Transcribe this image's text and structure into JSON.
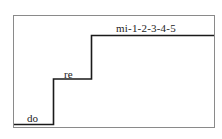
{
  "diagram": {
    "type": "staircase",
    "colors": {
      "frame": "#8a8a8a",
      "steps": "#1a1a1a",
      "text": "#222222"
    },
    "steps": [
      {
        "label": "do"
      },
      {
        "label": "re"
      },
      {
        "label": "mi-1-2-3-4-5"
      }
    ]
  }
}
